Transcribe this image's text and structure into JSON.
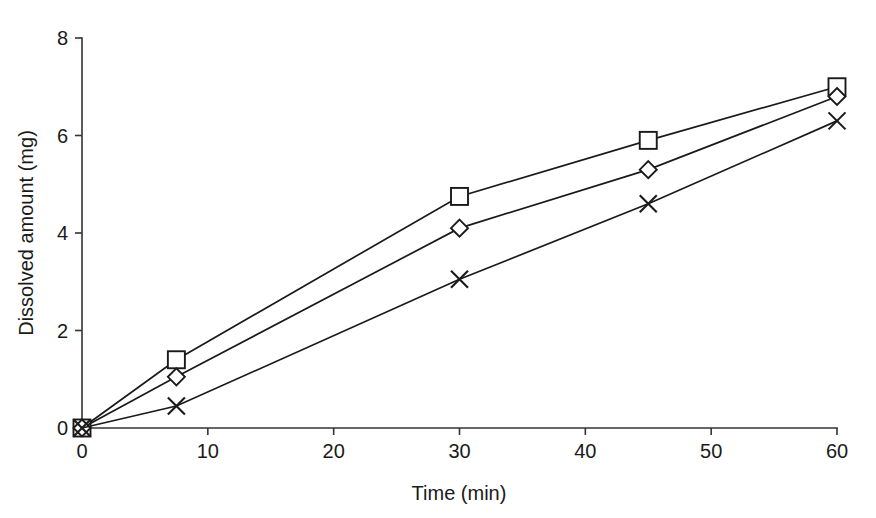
{
  "chart_data": {
    "type": "line",
    "title": "",
    "subtitle": "",
    "xlabel": "Time (min)",
    "ylabel": "Dissolved amount (mg)",
    "xlim": [
      0,
      60
    ],
    "ylim": [
      0,
      8
    ],
    "xticks": [
      0,
      10,
      20,
      30,
      40,
      50,
      60
    ],
    "yticks": [
      0,
      2,
      4,
      6,
      8
    ],
    "xtick_labels": [
      "0",
      "10",
      "20",
      "30",
      "40",
      "50",
      "60"
    ],
    "ytick_labels": [
      "0",
      "2",
      "4",
      "6",
      "8"
    ],
    "grid": false,
    "legend": false,
    "legend_position": "none",
    "x": [
      0,
      7.5,
      30,
      45,
      60
    ],
    "series": [
      {
        "name": "Series 1",
        "marker": "square",
        "color": "#1a1a1a",
        "values": [
          0,
          1.4,
          4.75,
          5.9,
          7.0
        ]
      },
      {
        "name": "Series 2",
        "marker": "diamond",
        "color": "#1a1a1a",
        "values": [
          0,
          1.05,
          4.1,
          5.3,
          6.8
        ]
      },
      {
        "name": "Series 3",
        "marker": "cross",
        "color": "#1a1a1a",
        "values": [
          0,
          0.45,
          3.05,
          4.6,
          6.3
        ]
      }
    ],
    "annotations": [],
    "background_color": "#ffffff",
    "axis_color": "#333333"
  },
  "figure": {
    "caption_sliver": "",
    "axis_title_x": "Time (min)",
    "axis_title_y": "Dissolved amount (mg)"
  }
}
